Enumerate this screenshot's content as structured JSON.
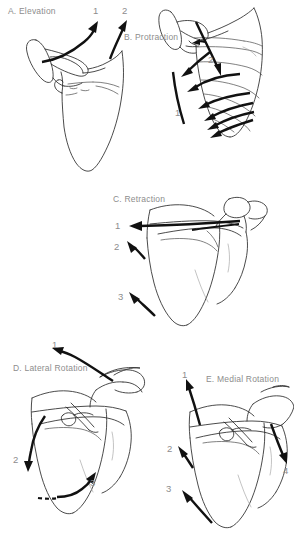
{
  "figure": {
    "background_color": "#ffffff",
    "label_color": "#8d8d8d",
    "line_color": "#2b2b2b",
    "arrow_color": "#111111",
    "width": 294,
    "height": 554
  },
  "panels": [
    {
      "id": "A",
      "label": "A. Elevation",
      "view": "posterior-scapula-left",
      "numbers": [
        {
          "text": "1",
          "meaning": "upward-lateral elevation vector"
        },
        {
          "text": "2",
          "meaning": "upward elevation vector at acromion"
        }
      ]
    },
    {
      "id": "B",
      "label": "B. Protraction",
      "view": "posterior-scapula-right",
      "numbers": [
        {
          "text": "1",
          "meaning": "medial border translation line"
        },
        {
          "text": "2",
          "meaning": "oblique protraction vector"
        }
      ]
    },
    {
      "id": "C",
      "label": "C. Retraction",
      "view": "anterior-scapula",
      "numbers": [
        {
          "text": "1",
          "meaning": "horizontal retraction vector at spine"
        },
        {
          "text": "2",
          "meaning": "superomedial retraction vector"
        },
        {
          "text": "3",
          "meaning": "inferomedial retraction vector"
        }
      ]
    },
    {
      "id": "D",
      "label": "D. Lateral Rotation",
      "view": "anterior-scapula",
      "numbers": [
        {
          "text": "1",
          "meaning": "superolateral rotation vector at acromion"
        },
        {
          "text": "2",
          "meaning": "inferior curved vector at medial border"
        },
        {
          "text": "3",
          "meaning": "inferior angle swing vector"
        }
      ]
    },
    {
      "id": "E",
      "label": "E. Medial Rotation",
      "view": "anterior-scapula",
      "numbers": [
        {
          "text": "1",
          "meaning": "superior medial rotation vector"
        },
        {
          "text": "2",
          "meaning": "superomedial vector at medial border"
        },
        {
          "text": "3",
          "meaning": "inferomedial vector at inferior angle"
        },
        {
          "text": "4",
          "meaning": "inferolateral vector at acromion"
        }
      ]
    }
  ]
}
